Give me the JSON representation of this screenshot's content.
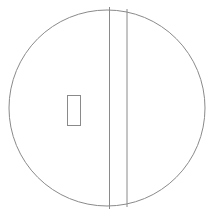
{
  "diagram": {
    "canvas": {
      "width": 210,
      "height": 215,
      "background": "#ffffff"
    },
    "stroke_color": "#8a8a8a",
    "stroke_width": 1,
    "circle": {
      "cx": 107,
      "cy": 108,
      "r": 98
    },
    "vertical_lines": [
      {
        "x": 109.5,
        "y1": 7,
        "y2": 209
      },
      {
        "x": 127,
        "y1": 9,
        "y2": 207
      }
    ],
    "rectangle": {
      "x": 67,
      "y": 95,
      "width": 13,
      "height": 30
    }
  }
}
